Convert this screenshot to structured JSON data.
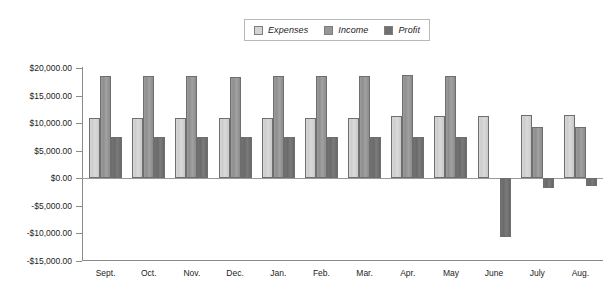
{
  "chart_data": {
    "type": "bar",
    "title": "",
    "subtitle": "",
    "xlabel": "",
    "ylabel": "",
    "grid": false,
    "legend_position": "top-center",
    "ylim": [
      -15000,
      20000
    ],
    "ytick_labels": [
      "$20,000.00",
      "$15,000.00",
      "$10,000.00",
      "$5,000.00",
      "$0.00",
      "-$5,000.00",
      "-$10,000.00",
      "-$15,000.00"
    ],
    "ytick_values": [
      20000,
      15000,
      10000,
      5000,
      0,
      -5000,
      -10000,
      -15000
    ],
    "categories": [
      "Sept.",
      "Oct.",
      "Nov.",
      "Dec.",
      "Jan.",
      "Feb.",
      "Mar.",
      "Apr.",
      "May",
      "June",
      "July",
      "Aug."
    ],
    "series": [
      {
        "name": "Expenses",
        "color": "#d3d3d3",
        "values": [
          11000,
          11000,
          11000,
          11000,
          11000,
          11000,
          11000,
          11200,
          11200,
          11200,
          11500,
          11500
        ]
      },
      {
        "name": "Income",
        "color": "#969696",
        "values": [
          18500,
          18500,
          18500,
          18400,
          18600,
          18600,
          18600,
          18700,
          18600,
          null,
          9300,
          9300
        ]
      },
      {
        "name": "Profit",
        "color": "#707070",
        "values": [
          7500,
          7500,
          7500,
          7500,
          7500,
          7500,
          7500,
          7500,
          7500,
          -10800,
          -1800,
          -1500
        ]
      }
    ]
  },
  "legend": {
    "entries": [
      {
        "label": "Expenses"
      },
      {
        "label": "Income"
      },
      {
        "label": "Profit"
      }
    ]
  }
}
